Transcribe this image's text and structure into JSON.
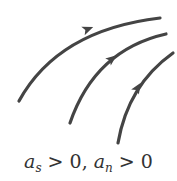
{
  "diagram": {
    "stroke_color": "#444444",
    "curves": [
      {
        "id": "streamline-1",
        "path": "M19,101 Q58,30 160,18",
        "arrow_at": [
          88,
          29
        ],
        "arrow_angle": -22
      },
      {
        "id": "streamline-2",
        "path": "M70,123 Q95,50 166,34",
        "arrow_at": [
          113,
          58
        ],
        "arrow_angle": -38
      },
      {
        "id": "streamline-3",
        "path": "M118,143 Q128,85 173,53",
        "arrow_at": [
          138,
          87
        ],
        "arrow_angle": -58
      }
    ],
    "caption": {
      "a_symbol": "a",
      "sub_s": "s",
      "sub_n": "n",
      "part1": " > 0, ",
      "part2": " > 0",
      "full_text": "a_s > 0, a_n > 0"
    }
  }
}
